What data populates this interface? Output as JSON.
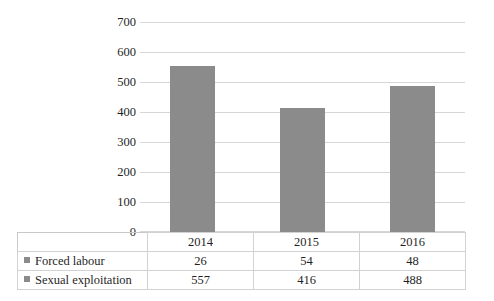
{
  "chart_data": {
    "type": "bar",
    "title": "",
    "subtitle": "",
    "xlabel": "",
    "ylabel": "",
    "categories": [
      "2014",
      "2015",
      "2016"
    ],
    "series": [
      {
        "name": "Forced labour",
        "values": [
          26,
          54,
          48
        ],
        "plotted_as_bars": false
      },
      {
        "name": "Sexual exploitation",
        "values": [
          557,
          416,
          488
        ],
        "plotted_as_bars": true
      }
    ],
    "ylim": [
      0,
      700
    ],
    "ytick_step": 100,
    "yticks": [
      "700",
      "600",
      "500",
      "400",
      "300",
      "200",
      "100",
      "0"
    ],
    "grid": true,
    "legend_position": "data-table-left",
    "bar_color": "#8b8b8b",
    "gridline_color": "#d6d6d6"
  },
  "axis": {
    "ticks": [
      {
        "label": "700",
        "value": 700
      },
      {
        "label": "600",
        "value": 600
      },
      {
        "label": "500",
        "value": 500
      },
      {
        "label": "400",
        "value": 400
      },
      {
        "label": "300",
        "value": 300
      },
      {
        "label": "200",
        "value": 200
      },
      {
        "label": "100",
        "value": 100
      },
      {
        "label": "0",
        "value": 0
      }
    ]
  },
  "table": {
    "years": [
      "2014",
      "2015",
      "2016"
    ],
    "rows": [
      {
        "label": "Forced labour",
        "values": [
          "26",
          "54",
          "48"
        ]
      },
      {
        "label": "Sexual exploitation",
        "values": [
          "557",
          "416",
          "488"
        ]
      }
    ]
  }
}
